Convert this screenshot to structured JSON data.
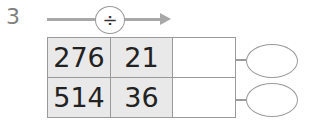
{
  "question": {
    "number": "3",
    "operation_symbol": "÷",
    "operation_icon": "divide-icon"
  },
  "table": {
    "rows": [
      {
        "dividend": "276",
        "divisor": "21",
        "answer": "",
        "remainder": ""
      },
      {
        "dividend": "514",
        "divisor": "36",
        "answer": "",
        "remainder": ""
      }
    ]
  },
  "colors": {
    "input_cell_bg": "#e9e9e9",
    "border": "#9a9a9a",
    "arrow": "#a8a8a8"
  }
}
